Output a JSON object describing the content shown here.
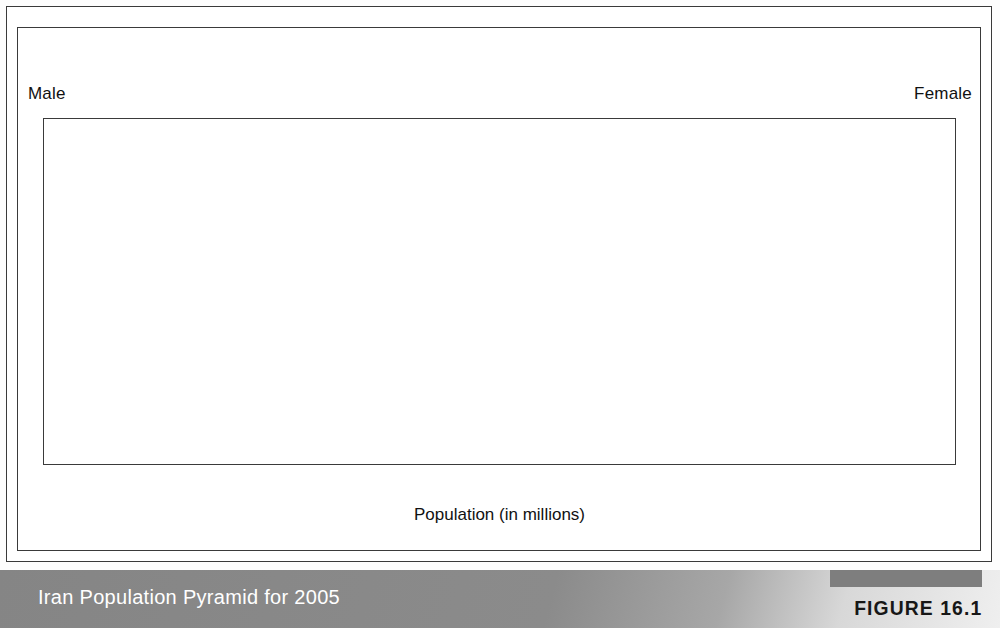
{
  "figure": {
    "caption": "Iran Population Pyramid for 2005",
    "figure_number": "FIGURE 16.1"
  },
  "labels": {
    "male": "Male",
    "female": "Female"
  },
  "axis": {
    "title": "Population (in millions)",
    "left_ticks": [
      "5",
      "4",
      "3",
      "2",
      "1",
      "0"
    ],
    "right_ticks": [
      "0",
      "1",
      "2",
      "3",
      "4",
      "5"
    ],
    "max": 5
  },
  "colors": {
    "bar_light": "#c4c4c4",
    "bar_mid": "#bdbdbd",
    "bar_dark": "#acacac",
    "bar_outline": "#2d2d2d",
    "frame": "#3a3a3a",
    "caption_band": "#8a8a8a",
    "caption_text": "#ffffff",
    "figure_tab": "#7e7e7e"
  },
  "chart_data": {
    "type": "bar",
    "subtype": "population-pyramid",
    "title": "Iran Population Pyramid for 2005",
    "xlabel": "Population (in millions)",
    "ylabel": "",
    "xlim": [
      0,
      5
    ],
    "grid": false,
    "legend": [
      "Male",
      "Female"
    ],
    "legend_position": "top-left / top-right",
    "categories": [
      "80+",
      "75-79",
      "70-74",
      "65-69",
      "60-64",
      "55-59",
      "50-54",
      "45-49",
      "40-44",
      "35-39",
      "30-34",
      "25-29",
      "20-24",
      "15-19",
      "10-14",
      "5-9",
      "0-4"
    ],
    "series": [
      {
        "name": "Male",
        "direction": "left",
        "values": [
          0.3,
          0.35,
          0.53,
          0.69,
          0.72,
          0.95,
          1.23,
          1.57,
          1.92,
          2.37,
          2.9,
          3.55,
          4.47,
          4.75,
          3.72,
          3.08,
          2.88
        ]
      },
      {
        "name": "Female",
        "direction": "right",
        "values": [
          0.3,
          0.37,
          0.5,
          0.62,
          0.72,
          0.88,
          1.26,
          1.58,
          1.94,
          2.3,
          2.77,
          3.31,
          4.15,
          4.43,
          3.54,
          2.88,
          2.73
        ]
      }
    ],
    "bar_tones": [
      "light",
      "light",
      "mid",
      "dark",
      "mid",
      "dark",
      "light",
      "mid",
      "mid",
      "dark",
      "mid",
      "mid",
      "light",
      "mid",
      "mid",
      "dark",
      "mid"
    ]
  }
}
